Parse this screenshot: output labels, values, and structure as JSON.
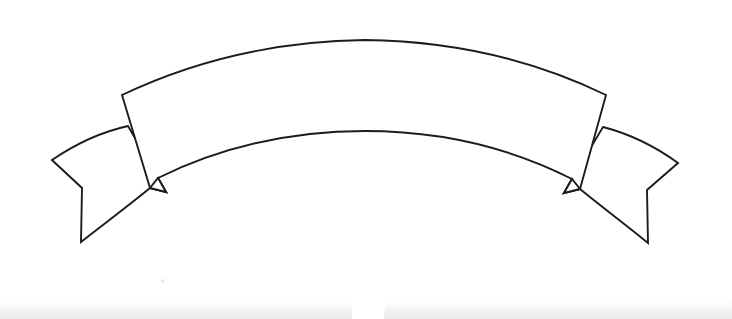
{
  "document": {
    "title": "Blank Arched Ribbon Banner",
    "background_color": "#ffffff",
    "width": 732,
    "height": 319
  },
  "artwork": {
    "name": "blank-arched-ribbon-banner",
    "style": "black-and-white line drawing",
    "stroke_color": "#1c1c1c",
    "fill_color": "#ffffff",
    "caption": "",
    "parts": [
      {
        "name": "center-arched-band",
        "label": "Center arched banner band",
        "has_text": false
      },
      {
        "name": "left-ribbon-tail",
        "label": "Left swallowtail ribbon end",
        "has_text": false
      },
      {
        "name": "right-ribbon-tail",
        "label": "Right swallowtail ribbon end",
        "has_text": false
      },
      {
        "name": "left-fold",
        "label": "Left fold notch",
        "has_text": false
      },
      {
        "name": "right-fold",
        "label": "Right fold notch",
        "has_text": false
      }
    ]
  },
  "scan_artifacts": {
    "left_band_label": "",
    "right_band_label": "",
    "shade_color": "#ededed"
  }
}
